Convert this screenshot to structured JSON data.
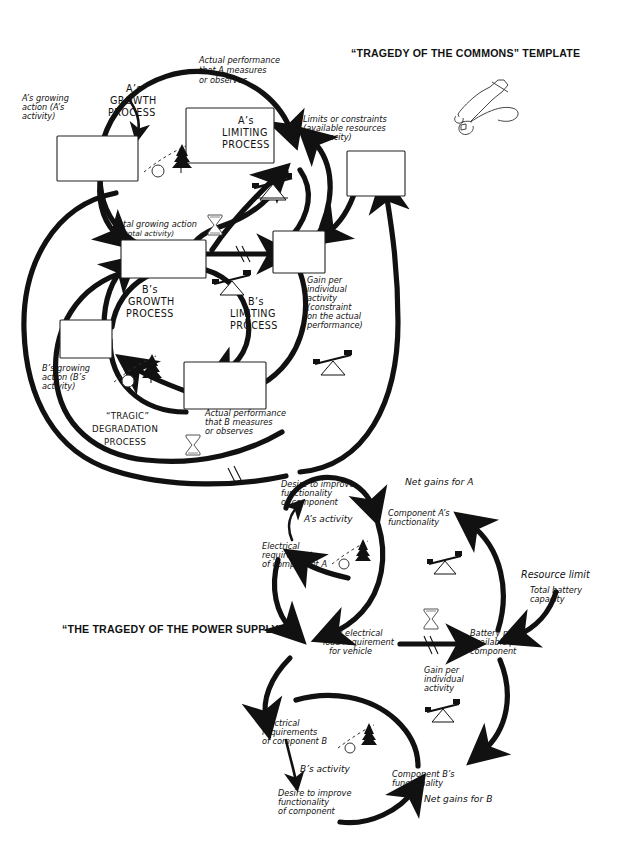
{
  "page": {
    "title_top": "“TRAGEDY OF THE COMMONS” TEMPLATE",
    "title_bottom": "“THE TRAGEDY OF THE POWER SUPPLY”",
    "tools_icon": "hammer-and-wrench-icon"
  },
  "template": {
    "loops": {
      "a_growth": "A’s\nGROWTH\nPROCESS",
      "a_growth_l1": "A’s",
      "a_growth_l2": "GROWTH",
      "a_growth_l3": "PROCESS",
      "a_limiting_l1": "A’s",
      "a_limiting_l2": "LIMITING",
      "a_limiting_l3": "PROCESS",
      "b_growth_l1": "B’s",
      "b_growth_l2": "GROWTH",
      "b_growth_l3": "PROCESS",
      "b_limiting_l1": "B’s",
      "b_limiting_l2": "LIMITING",
      "b_limiting_l3": "PROCESS",
      "tragic_l1": "“TRAGIC”",
      "tragic_l2": "DEGRADATION",
      "tragic_l3": "PROCESS"
    },
    "labels": {
      "a_growing_l1": "A’s growing",
      "a_growing_l2": "action (A’s",
      "a_growing_l3": "activity)",
      "a_actual_l1": "Actual performance",
      "a_actual_l2": "that A measures",
      "a_actual_l3": "or observes",
      "limits_l1": "Limits or constraints",
      "limits_l2": "(available resources",
      "limits_l3": "or capacity)",
      "total_growing_l1": "Total growing action",
      "total_growing_l2": "(total activity)",
      "gain_l1": "Gain per",
      "gain_l2": "individual",
      "gain_l3": "activity",
      "gain_l4": "(constraint",
      "gain_l5": "on the actual",
      "gain_l6": "performance)",
      "b_growing_l1": "B’s growing",
      "b_growing_l2": "action (B’s",
      "b_growing_l3": "activity)",
      "b_actual_l1": "Actual performance",
      "b_actual_l2": "that B measures",
      "b_actual_l3": "or observes"
    },
    "variable_boxes": [
      {
        "name": "a-growing-action-box",
        "text": ""
      },
      {
        "name": "a-actual-performance-box",
        "text": ""
      },
      {
        "name": "limits-or-constraints-box",
        "text": ""
      },
      {
        "name": "total-growing-action-box",
        "text": ""
      },
      {
        "name": "gain-per-individual-activity-box",
        "text": ""
      },
      {
        "name": "b-growing-action-box",
        "text": ""
      },
      {
        "name": "b-actual-performance-box",
        "text": ""
      }
    ]
  },
  "example": {
    "labels": {
      "a_desire_l1": "Desire to improve",
      "a_desire_l2": "functionality",
      "a_desire_l3": "of component",
      "a_activity": "A’s activity",
      "net_gains_a": "Net gains for A",
      "comp_a_func_l1": "Component A’s",
      "comp_a_func_l2": "functionality",
      "elec_req_a_l1": "Electrical",
      "elec_req_a_l2": "requirements",
      "elec_req_a_l3": "of component A",
      "resource_limit": "Resource limit",
      "total_battery_l1": "Total battery",
      "total_battery_l2": "capacity",
      "total_load_l1": "Total electrical",
      "total_load_l2": "load requirement",
      "total_load_l3": "for vehicle",
      "battery_power_l1": "Battery power",
      "battery_power_l2": "available per",
      "battery_power_l3": "component",
      "gain_l1": "Gain per",
      "gain_l2": "individual",
      "gain_l3": "activity",
      "elec_req_b_l1": "Electrical",
      "elec_req_b_l2": "requirements",
      "elec_req_b_l3": "of component B",
      "b_activity": "B’s activity",
      "b_desire_l1": "Desire to improve",
      "b_desire_l2": "functionality",
      "b_desire_l3": "of component",
      "comp_b_func_l1": "Component B’s",
      "comp_b_func_l2": "functionality",
      "net_gains_b": "Net gains for B"
    }
  },
  "icons": {
    "snowball_growth": "snowball-growth-icon",
    "seesaw_balance": "seesaw-balance-icon",
    "hourglass_delay": "hourglass-delay-icon",
    "tools": "hammer-wrench-icon"
  },
  "colors": {
    "ink": "#111111",
    "paper": "#ffffff",
    "box_stroke": "#222222"
  }
}
